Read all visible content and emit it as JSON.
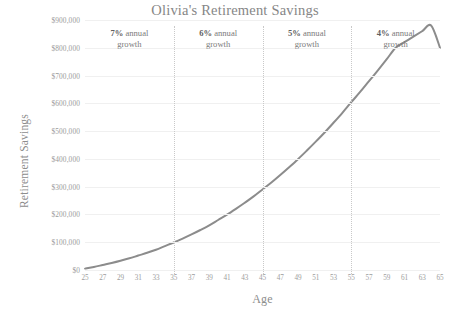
{
  "chart_data": {
    "type": "line",
    "title": "Olivia's Retirement Savings",
    "xlabel": "Age",
    "ylabel": "Retirement Savings",
    "xlim": [
      25,
      65
    ],
    "ylim": [
      0,
      900000
    ],
    "grid": true,
    "legend": "none",
    "y_ticks": [
      "$900,000",
      "$800,000",
      "$700,000",
      "$600,000",
      "$500,000",
      "$400,000",
      "$300,000",
      "$200,000",
      "$100,000",
      "$0"
    ],
    "y_tick_values": [
      900000,
      800000,
      700000,
      600000,
      500000,
      400000,
      300000,
      200000,
      100000,
      0
    ],
    "x_ticks": [
      "25",
      "27",
      "29",
      "31",
      "33",
      "35",
      "37",
      "39",
      "41",
      "43",
      "45",
      "47",
      "49",
      "51",
      "53",
      "55",
      "57",
      "59",
      "61",
      "63",
      "65"
    ],
    "x_tick_values": [
      25,
      27,
      29,
      31,
      33,
      35,
      37,
      39,
      41,
      43,
      45,
      47,
      49,
      51,
      53,
      55,
      57,
      59,
      61,
      63,
      65
    ],
    "series": [
      {
        "name": "Retirement Savings",
        "color": "#8c8c8c",
        "x": [
          25,
          26,
          27,
          28,
          29,
          30,
          31,
          32,
          33,
          34,
          35,
          36,
          37,
          38,
          39,
          40,
          41,
          42,
          43,
          44,
          45,
          46,
          47,
          48,
          49,
          50,
          51,
          52,
          53,
          54,
          55,
          56,
          57,
          58,
          59,
          60,
          61,
          62,
          63,
          64,
          65
        ],
        "values": [
          5000,
          11000,
          18000,
          25000,
          33000,
          42000,
          52000,
          62000,
          73000,
          86000,
          99000,
          113000,
          128000,
          144000,
          161000,
          180000,
          199000,
          220000,
          242000,
          265000,
          290000,
          315000,
          342000,
          370000,
          399000,
          430000,
          462000,
          495000,
          530000,
          566000,
          604000,
          641000,
          680000,
          719000,
          759000,
          800000,
          820000,
          840000,
          860000,
          880000,
          800000
        ]
      }
    ],
    "segments": [
      {
        "id": "segment-7",
        "rate": "7%",
        "label": " annual growth",
        "label_line1_rate": "7%",
        "label_line1_text": " annual",
        "label_line2": "growth",
        "start_age": 25,
        "end_age": 35
      },
      {
        "id": "segment-6",
        "rate": "6%",
        "label": " annual growth",
        "label_line1_rate": "6%",
        "label_line1_text": " annual",
        "label_line2": "growth",
        "start_age": 35,
        "end_age": 45
      },
      {
        "id": "segment-5",
        "rate": "5%",
        "label": " annual growth",
        "label_line1_rate": "5%",
        "label_line1_text": " annual",
        "label_line2": "growth",
        "start_age": 45,
        "end_age": 55
      },
      {
        "id": "segment-4",
        "rate": "4%",
        "label": " annual growth",
        "label_line1_rate": "4%",
        "label_line1_text": " annual",
        "label_line2": "growth",
        "start_age": 55,
        "end_age": 65
      }
    ],
    "divider_ages": [
      35,
      45,
      55
    ],
    "annotations": [
      {
        "text": "7% annual growth"
      },
      {
        "text": "6% annual growth"
      },
      {
        "text": "5% annual growth"
      },
      {
        "text": "4% annual growth"
      }
    ],
    "colors": {
      "line": "#8c8c8c",
      "grid": "#f0f0f0",
      "divider": "#c9c9c9",
      "text": "#8d8d8d",
      "background": "#ffffff"
    }
  }
}
